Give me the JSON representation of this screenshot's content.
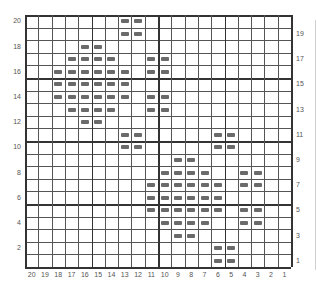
{
  "chart": {
    "columns": 20,
    "rows": 20,
    "column_labels": [
      "20",
      "19",
      "18",
      "17",
      "16",
      "15",
      "14",
      "13",
      "12",
      "11",
      "10",
      "9",
      "8",
      "7",
      "6",
      "5",
      "4",
      "3",
      "2",
      "1"
    ],
    "left_row_labels": [
      "20",
      "18",
      "16",
      "14",
      "12",
      "10",
      "8",
      "6",
      "4",
      "2"
    ],
    "right_row_labels": [
      "19",
      "17",
      "15",
      "13",
      "11",
      "9",
      "7",
      "5",
      "3",
      "1"
    ],
    "stitch_symbol": "purl-dash",
    "stitch_color": "#6a6a6a",
    "filled_cells": {
      "20": [
        13,
        12
      ],
      "19": [
        13,
        12
      ],
      "18": [
        16,
        15
      ],
      "17": [
        17,
        16,
        15,
        14,
        11,
        10
      ],
      "16": [
        18,
        17,
        16,
        15,
        14,
        13,
        11,
        10
      ],
      "15": [
        18,
        17,
        16,
        15,
        14,
        13
      ],
      "14": [
        18,
        17,
        16,
        15,
        14,
        13,
        11,
        10
      ],
      "13": [
        17,
        16,
        15,
        14,
        11,
        10
      ],
      "12": [
        16,
        15
      ],
      "11": [
        13,
        12,
        6,
        5
      ],
      "10": [
        13,
        12,
        6,
        5
      ],
      "9": [
        9,
        8
      ],
      "8": [
        10,
        9,
        8,
        7,
        4,
        3
      ],
      "7": [
        11,
        10,
        9,
        8,
        7,
        6,
        4,
        3
      ],
      "6": [
        11,
        10,
        9,
        8,
        7,
        6
      ],
      "5": [
        11,
        10,
        9,
        8,
        7,
        6,
        4,
        3
      ],
      "4": [
        10,
        9,
        8,
        7,
        4,
        3
      ],
      "3": [
        9,
        8
      ],
      "2": [
        6,
        5
      ],
      "1": [
        6,
        5
      ]
    }
  }
}
